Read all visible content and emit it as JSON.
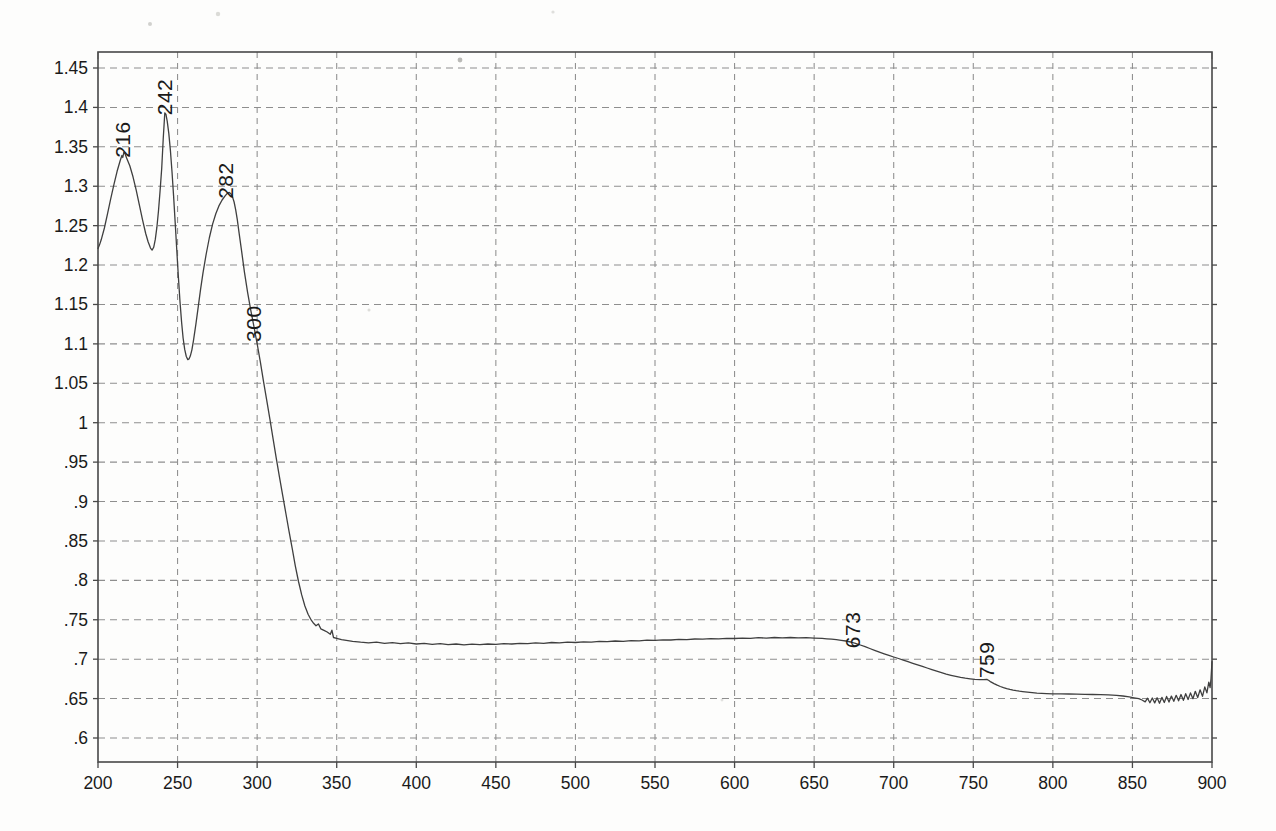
{
  "page": {
    "background": "#fdfdfc"
  },
  "styles": {
    "curve_color": "#3f3f3f",
    "grid_color": "#8e8e8e",
    "frame_color": "#484848",
    "label_color": "#1a1a1a",
    "tick_font_px": 17.5,
    "annotation_font_px": 21
  },
  "chart_data": {
    "type": "line",
    "title": "",
    "xlabel": "",
    "ylabel": "",
    "x_range": [
      200,
      900
    ],
    "y_range": [
      0.6,
      1.45
    ],
    "grid": "dashed",
    "legend": "none",
    "x_ticks": [
      {
        "value": 200,
        "label": "200"
      },
      {
        "value": 250,
        "label": "250"
      },
      {
        "value": 300,
        "label": "300"
      },
      {
        "value": 350,
        "label": "350"
      },
      {
        "value": 400,
        "label": "400"
      },
      {
        "value": 450,
        "label": "450"
      },
      {
        "value": 500,
        "label": "500"
      },
      {
        "value": 550,
        "label": "550"
      },
      {
        "value": 600,
        "label": "600"
      },
      {
        "value": 650,
        "label": "650"
      },
      {
        "value": 700,
        "label": "700"
      },
      {
        "value": 750,
        "label": "750"
      },
      {
        "value": 800,
        "label": "800"
      },
      {
        "value": 850,
        "label": "850"
      },
      {
        "value": 900,
        "label": "900"
      }
    ],
    "y_ticks": [
      {
        "value": 1.45,
        "label": "1.45"
      },
      {
        "value": 1.4,
        "label": "1.4"
      },
      {
        "value": 1.35,
        "label": "1.35"
      },
      {
        "value": 1.3,
        "label": "1.3"
      },
      {
        "value": 1.25,
        "label": "1.25"
      },
      {
        "value": 1.2,
        "label": "1.2"
      },
      {
        "value": 1.15,
        "label": "1.15"
      },
      {
        "value": 1.1,
        "label": "1.1"
      },
      {
        "value": 1.05,
        "label": "1.05"
      },
      {
        "value": 1.0,
        "label": "1"
      },
      {
        "value": 0.95,
        "label": ".95"
      },
      {
        "value": 0.9,
        "label": ".9"
      },
      {
        "value": 0.85,
        "label": ".85"
      },
      {
        "value": 0.8,
        "label": ".8"
      },
      {
        "value": 0.75,
        "label": ".75"
      },
      {
        "value": 0.7,
        "label": ".7"
      },
      {
        "value": 0.65,
        "label": ".65"
      },
      {
        "value": 0.6,
        "label": ".6"
      }
    ],
    "peak_annotations": [
      {
        "text": "216",
        "nm": 220,
        "A": 1.336
      },
      {
        "text": "242",
        "nm": 246.5,
        "A": 1.39
      },
      {
        "text": "282",
        "nm": 285,
        "A": 1.284
      },
      {
        "text": "300",
        "nm": 302.5,
        "A": 1.1025
      },
      {
        "text": "673",
        "nm": 679,
        "A": 0.714
      },
      {
        "text": "759",
        "nm": 763,
        "A": 0.676
      }
    ],
    "series": [
      {
        "name": "absorbance-spectrum",
        "points": [
          [
            200,
            1.221
          ],
          [
            201,
            1.226
          ],
          [
            202,
            1.232
          ],
          [
            204,
            1.247
          ],
          [
            206,
            1.265
          ],
          [
            208,
            1.284
          ],
          [
            210,
            1.302
          ],
          [
            212,
            1.319
          ],
          [
            214,
            1.333
          ],
          [
            215,
            1.339
          ],
          [
            215.6,
            1.3365
          ],
          [
            216.2,
            1.343
          ],
          [
            217,
            1.341
          ],
          [
            218,
            1.336
          ],
          [
            220,
            1.326
          ],
          [
            222,
            1.312
          ],
          [
            224,
            1.295
          ],
          [
            226,
            1.276
          ],
          [
            228,
            1.257
          ],
          [
            230,
            1.24
          ],
          [
            231.5,
            1.2295
          ],
          [
            233,
            1.2215
          ],
          [
            234,
            1.219
          ],
          [
            235,
            1.2225
          ],
          [
            236,
            1.2325
          ],
          [
            237,
            1.248
          ],
          [
            238,
            1.269
          ],
          [
            239,
            1.2945
          ],
          [
            240,
            1.3225
          ],
          [
            241,
            1.3595
          ],
          [
            242,
            1.393
          ],
          [
            242.7,
            1.391
          ],
          [
            243.5,
            1.3825
          ],
          [
            244.5,
            1.367
          ],
          [
            245.5,
            1.3455
          ],
          [
            246.5,
            1.3185
          ],
          [
            247.5,
            1.2875
          ],
          [
            248.5,
            1.2535
          ],
          [
            249.5,
            1.2185
          ],
          [
            250.5,
            1.1845
          ],
          [
            251.5,
            1.1535
          ],
          [
            252.5,
            1.1275
          ],
          [
            253.5,
            1.1075
          ],
          [
            254.5,
            1.093
          ],
          [
            255.5,
            1.084
          ],
          [
            256.4,
            1.08
          ],
          [
            257.2,
            1.081
          ],
          [
            258,
            1.0845
          ],
          [
            259,
            1.0925
          ],
          [
            260,
            1.1045
          ],
          [
            261.5,
            1.125
          ],
          [
            263,
            1.1475
          ],
          [
            264.5,
            1.1695
          ],
          [
            266,
            1.19
          ],
          [
            268,
            1.214
          ],
          [
            270,
            1.235
          ],
          [
            272,
            1.252
          ],
          [
            274,
            1.265
          ],
          [
            276,
            1.275
          ],
          [
            278,
            1.2825
          ],
          [
            280,
            1.288
          ],
          [
            281.5,
            1.2915
          ],
          [
            282.5,
            1.292
          ],
          [
            283.5,
            1.2905
          ],
          [
            284.5,
            1.2865
          ],
          [
            285.5,
            1.28
          ],
          [
            286.5,
            1.27
          ],
          [
            287.5,
            1.2575
          ],
          [
            288.5,
            1.2435
          ],
          [
            290,
            1.2215
          ],
          [
            292,
            1.1915
          ],
          [
            294,
            1.1655
          ],
          [
            296,
            1.1425
          ],
          [
            298,
            1.1215
          ],
          [
            300,
            1.1005
          ],
          [
            302,
            1.0775
          ],
          [
            304,
            1.0525
          ],
          [
            306,
            1.0285
          ],
          [
            308,
            1.0045
          ],
          [
            310,
            0.9795
          ],
          [
            312,
            0.9555
          ],
          [
            314,
            0.9315
          ],
          [
            316,
            0.9085
          ],
          [
            318,
            0.8855
          ],
          [
            320,
            0.8625
          ],
          [
            322,
            0.8405
          ],
          [
            324,
            0.8185
          ],
          [
            326,
            0.7985
          ],
          [
            328,
            0.7815
          ],
          [
            330,
            0.7675
          ],
          [
            332,
            0.757
          ],
          [
            334,
            0.7495
          ],
          [
            335.5,
            0.7455
          ],
          [
            337,
            0.7425
          ],
          [
            338.5,
            0.7448
          ],
          [
            340,
            0.7385
          ],
          [
            342,
            0.7365
          ],
          [
            344,
            0.7345
          ],
          [
            346,
            0.7315
          ],
          [
            347,
            0.7368
          ],
          [
            348,
            0.7275
          ],
          [
            350,
            0.7265
          ],
          [
            353,
            0.7248
          ],
          [
            356,
            0.7238
          ],
          [
            360,
            0.7225
          ],
          [
            365,
            0.7215
          ],
          [
            370,
            0.7208
          ],
          [
            375,
            0.7216
          ],
          [
            380,
            0.72
          ],
          [
            385,
            0.721
          ],
          [
            390,
            0.7197
          ],
          [
            395,
            0.7206
          ],
          [
            400,
            0.7192
          ],
          [
            405,
            0.72
          ],
          [
            410,
            0.7188
          ],
          [
            415,
            0.7196
          ],
          [
            420,
            0.7184
          ],
          [
            425,
            0.7192
          ],
          [
            430,
            0.7183
          ],
          [
            435,
            0.7191
          ],
          [
            440,
            0.7185
          ],
          [
            445,
            0.7193
          ],
          [
            450,
            0.7188
          ],
          [
            455,
            0.7197
          ],
          [
            460,
            0.7192
          ],
          [
            465,
            0.7201
          ],
          [
            470,
            0.7197
          ],
          [
            475,
            0.7206
          ],
          [
            480,
            0.7202
          ],
          [
            485,
            0.7211
          ],
          [
            490,
            0.7208
          ],
          [
            495,
            0.7216
          ],
          [
            500,
            0.7212
          ],
          [
            505,
            0.7221
          ],
          [
            510,
            0.7217
          ],
          [
            515,
            0.7226
          ],
          [
            520,
            0.7222
          ],
          [
            525,
            0.7231
          ],
          [
            530,
            0.7227
          ],
          [
            535,
            0.7236
          ],
          [
            540,
            0.7232
          ],
          [
            545,
            0.7241
          ],
          [
            550,
            0.7238
          ],
          [
            555,
            0.7246
          ],
          [
            560,
            0.7243
          ],
          [
            565,
            0.7251
          ],
          [
            570,
            0.7248
          ],
          [
            575,
            0.7256
          ],
          [
            580,
            0.7253
          ],
          [
            585,
            0.7261
          ],
          [
            590,
            0.7258
          ],
          [
            595,
            0.7265
          ],
          [
            600,
            0.7262
          ],
          [
            605,
            0.7268
          ],
          [
            610,
            0.7265
          ],
          [
            615,
            0.7272
          ],
          [
            620,
            0.7268
          ],
          [
            625,
            0.7275
          ],
          [
            630,
            0.727
          ],
          [
            635,
            0.7275
          ],
          [
            640,
            0.727
          ],
          [
            645,
            0.7273
          ],
          [
            650,
            0.7268
          ],
          [
            655,
            0.7263
          ],
          [
            658,
            0.7258
          ],
          [
            661,
            0.7253
          ],
          [
            664,
            0.7247
          ],
          [
            667,
            0.724
          ],
          [
            670,
            0.7231
          ],
          [
            673,
            0.7218
          ],
          [
            676,
            0.72
          ],
          [
            679,
            0.718
          ],
          [
            682,
            0.7158
          ],
          [
            685,
            0.7135
          ],
          [
            688,
            0.7112
          ],
          [
            691,
            0.709
          ],
          [
            694,
            0.7068
          ],
          [
            697,
            0.7048
          ],
          [
            700,
            0.7028
          ],
          [
            703,
            0.7008
          ],
          [
            706,
            0.6988
          ],
          [
            709,
            0.6968
          ],
          [
            712,
            0.6948
          ],
          [
            715,
            0.6928
          ],
          [
            718,
            0.6908
          ],
          [
            721,
            0.6888
          ],
          [
            724,
            0.6868
          ],
          [
            727,
            0.6848
          ],
          [
            730,
            0.6829
          ],
          [
            733,
            0.6811
          ],
          [
            736,
            0.6795
          ],
          [
            739,
            0.6781
          ],
          [
            742,
            0.6769
          ],
          [
            745,
            0.6759
          ],
          [
            748,
            0.6751
          ],
          [
            751,
            0.6745
          ],
          [
            754,
            0.6741
          ],
          [
            756.5,
            0.6739
          ],
          [
            758.5,
            0.6744
          ],
          [
            759.8,
            0.673
          ],
          [
            761,
            0.6712
          ],
          [
            763,
            0.669
          ],
          [
            765,
            0.667
          ],
          [
            767,
            0.6653
          ],
          [
            769,
            0.6639
          ],
          [
            771,
            0.6627
          ],
          [
            773,
            0.6617
          ],
          [
            775,
            0.6608
          ],
          [
            777,
            0.66
          ],
          [
            779,
            0.6594
          ],
          [
            781,
            0.6589
          ],
          [
            784,
            0.6581
          ],
          [
            787,
            0.6575
          ],
          [
            790,
            0.657
          ],
          [
            793,
            0.6566
          ],
          [
            796,
            0.6563
          ],
          [
            800,
            0.656
          ],
          [
            805,
            0.6559
          ],
          [
            810,
            0.6558
          ],
          [
            815,
            0.6556
          ],
          [
            820,
            0.6555
          ],
          [
            825,
            0.6552
          ],
          [
            830,
            0.655
          ],
          [
            835,
            0.6547
          ],
          [
            840,
            0.6542
          ],
          [
            844,
            0.6533
          ],
          [
            848,
            0.6521
          ],
          [
            851,
            0.651
          ],
          [
            854,
            0.6498
          ],
          [
            856,
            0.6482
          ],
          [
            858,
            0.6458
          ],
          [
            859.5,
            0.6505
          ],
          [
            861,
            0.6448
          ],
          [
            862.5,
            0.6508
          ],
          [
            864,
            0.6445
          ],
          [
            865.5,
            0.651
          ],
          [
            867,
            0.6442
          ],
          [
            868.5,
            0.6515
          ],
          [
            870,
            0.645
          ],
          [
            871.5,
            0.6528
          ],
          [
            873,
            0.6455
          ],
          [
            874.5,
            0.6532
          ],
          [
            876,
            0.6465
          ],
          [
            877.5,
            0.6542
          ],
          [
            879,
            0.6472
          ],
          [
            880.5,
            0.6552
          ],
          [
            882,
            0.6478
          ],
          [
            883.5,
            0.6562
          ],
          [
            885,
            0.6488
          ],
          [
            886.5,
            0.6572
          ],
          [
            888,
            0.6498
          ],
          [
            889.5,
            0.6592
          ],
          [
            891,
            0.6512
          ],
          [
            892.5,
            0.6612
          ],
          [
            894,
            0.6528
          ],
          [
            895.5,
            0.6648
          ],
          [
            896.8,
            0.6572
          ],
          [
            898,
            0.6708
          ],
          [
            898.8,
            0.6638
          ],
          [
            899.4,
            0.6752
          ],
          [
            900,
            0.6968
          ]
        ]
      }
    ]
  }
}
